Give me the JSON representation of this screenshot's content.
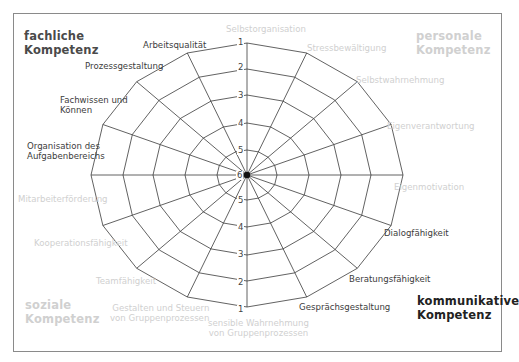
{
  "diagram": {
    "type": "competence-radar-web",
    "scale_labels": [
      "1",
      "2",
      "3",
      "4",
      "5",
      "6"
    ],
    "colors": {
      "line": "#3a3a3a",
      "dark_text": "#3c3c3c",
      "light_text": "#d0d0d0",
      "frame": "#8a8a8a"
    },
    "corner_labels": {
      "top_left": {
        "line1": "fachliche",
        "line2": "Kompetenz"
      },
      "top_right": {
        "line1": "personale",
        "line2": "Kompetenz"
      },
      "bottom_left": {
        "line1": "soziale",
        "line2": "Kompetenz"
      },
      "bottom_right": {
        "line1": "kommunikative",
        "line2": "Kompetenz"
      }
    },
    "axes": [
      {
        "label": "Selbstorganisation"
      },
      {
        "label": "Stressbewältigung"
      },
      {
        "label": "Selbstwahrnehmung"
      },
      {
        "label": "Eigenverantwortung"
      },
      {
        "label": "Eigenmotivation"
      },
      {
        "label": "Dialogfähigkeit"
      },
      {
        "label": "Beratungsfähigkeit"
      },
      {
        "label": "Gesprächsgestaltung"
      },
      {
        "line1": "sensible Wahrnehmung",
        "line2": "von Gruppenprozessen"
      },
      {
        "line1": "Gestalten und Steuern",
        "line2": "von Gruppenprozessen"
      },
      {
        "label": "Teamfähigkeit"
      },
      {
        "label": "Kooperationsfähigkeit"
      },
      {
        "label": "Mitarbeiterförderung"
      },
      {
        "line1": "Organisation des",
        "line2": "Aufgabenbereichs"
      },
      {
        "line1": "Fachwissen und",
        "line2": "Können"
      },
      {
        "label": "Prozessgestaltung"
      },
      {
        "label": "Arbeitsqualität"
      }
    ]
  }
}
